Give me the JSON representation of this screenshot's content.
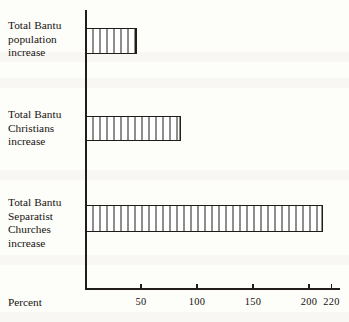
{
  "chart_data": {
    "type": "bar",
    "orientation": "horizontal",
    "title": "",
    "xlabel": "Percent",
    "ylabel": "",
    "categories": [
      "Total Bantu\npopulation\nincrease",
      "Total Bantu\nChristians\nincrease",
      "Total Bantu\nSeparatist\nChurches\nincrease"
    ],
    "values": [
      45,
      84,
      211
    ],
    "xlim": [
      0,
      220
    ],
    "xticks": [
      50,
      100,
      150,
      200,
      220
    ],
    "xticklabels": [
      "50",
      "100",
      "150",
      "200",
      "220"
    ],
    "grid": false,
    "legend": null,
    "series": [
      {
        "name": "Percent increase",
        "values": [
          45,
          84,
          211
        ]
      }
    ],
    "bar_style": {
      "fill": "vertical-hatch",
      "outline_color": "#211d18",
      "fill_color": "#ffffff"
    }
  },
  "axis": {
    "title": "Percent",
    "ticks": [
      {
        "label": "50",
        "value": 50,
        "x_px": 141
      },
      {
        "label": "100",
        "value": 100,
        "x_px": 197
      },
      {
        "label": "150",
        "value": 150,
        "x_px": 253
      },
      {
        "label": "200",
        "value": 200,
        "x_px": 309
      },
      {
        "label": "220",
        "value": 220,
        "x_px": 331
      }
    ]
  },
  "bars": [
    {
      "label": "Total Bantu\npopulation\nincrease",
      "value": 45,
      "width_px": 50.4
    },
    {
      "label": "Total Bantu\nChristians\nincrease",
      "value": 84,
      "width_px": 94.1
    },
    {
      "label": "Total Bantu\nSeparatist\nChurches\nincrease",
      "value": 211,
      "width_px": 236.3
    }
  ],
  "colors": {
    "ink": "#211d18",
    "paper": "#fdfdfa",
    "text": "#17130f"
  }
}
